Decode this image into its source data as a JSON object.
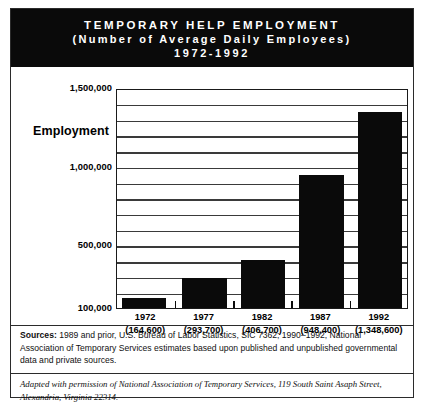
{
  "header": {
    "line1": "TEMPORARY HELP EMPLOYMENT",
    "line2": "(Number of Average Daily Employees)",
    "line3": "1972-1992"
  },
  "axis": {
    "y_axis_title": "Employment"
  },
  "notes": {
    "sources_label": "Sources:",
    "sources_text": " 1989 and prior, U.S. Bureau of Labor Statistics, SIC 7362; 1990–1992, National Association of Temporary  Services estimates based upon published and unpublished governmental data and private sources.",
    "adapted_text": "Adapted with permission of National Association of Temporary Services, 119 South Saint Asaph Street, Alexandria, Virginia 22314."
  },
  "colors": {
    "bar_fill": "#0a0a0a",
    "banner_background": "#0a0a0a",
    "banner_text": "#ffffff",
    "gridline": "#3a3a3a",
    "page_background": "#ffffff"
  },
  "chart_data": {
    "type": "bar",
    "title": "TEMPORARY HELP EMPLOYMENT (Number of Average Daily Employees) 1972-1992",
    "xlabel": "",
    "ylabel": "Employment",
    "categories": [
      "1972",
      "1977",
      "1982",
      "1987",
      "1992"
    ],
    "values": [
      164600,
      293700,
      406700,
      948400,
      1348600
    ],
    "value_labels": [
      "(164,600)",
      "(293,700)",
      "(406,700)",
      "(948,400)",
      "(1,348,600)"
    ],
    "ylim": [
      100000,
      1500000
    ],
    "ytick_labels": [
      "1,500,000",
      "1,000,000",
      "500,000",
      "100,000"
    ],
    "ytick_values": [
      1500000,
      1000000,
      500000,
      100000
    ],
    "gridline_step": 100000,
    "grid": true,
    "legend": "none"
  }
}
